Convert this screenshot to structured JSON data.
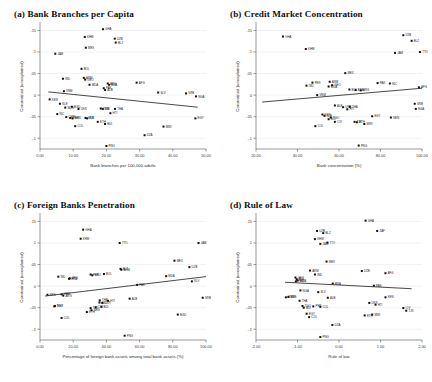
{
  "figure": {
    "width": 432,
    "height": 382,
    "background": "#ffffff",
    "marker_color": "#111111",
    "fitline_color": "#1a1a1a",
    "grid_color": "#e9e9ee",
    "axis_color": "#555555",
    "caption": ""
  },
  "chart_data": [
    {
      "type": "scatter",
      "panel": "a",
      "title": "(a) Bank Branches per Capita",
      "xlabel": "Bank branches per 100,000 adults",
      "ylabel": "Constrained (unexplained)",
      "xlim": [
        0,
        50
      ],
      "ylim": [
        -0.125,
        0.165
      ],
      "xticks": [
        0,
        10,
        20,
        30,
        40,
        50
      ],
      "xticklabels": [
        "0.00",
        "10.00",
        "20.00",
        "30.00",
        "40.00",
        "50.00"
      ],
      "yticks": [
        0.15,
        0.1,
        0.05,
        0,
        -0.05,
        -0.1
      ],
      "yticklabels": [
        ".15",
        ".1",
        ".05",
        "0",
        "-.05",
        "-.1"
      ],
      "grid": true,
      "fit_line": {
        "x": [
          2.5,
          47.5
        ],
        "y": [
          0.0075,
          -0.028
        ]
      },
      "points": [
        {
          "label": "GHA",
          "x": 19.0,
          "y": 0.153
        },
        {
          "label": "KHM",
          "x": 13.5,
          "y": 0.135
        },
        {
          "label": "UZB",
          "x": 22.5,
          "y": 0.131
        },
        {
          "label": "BLZ",
          "x": 22.8,
          "y": 0.122
        },
        {
          "label": "MEX",
          "x": 13.8,
          "y": 0.11
        },
        {
          "label": "JAM",
          "x": 4.6,
          "y": 0.096
        },
        {
          "label": "BOL",
          "x": 12.5,
          "y": 0.061
        },
        {
          "label": "IND",
          "x": 6.9,
          "y": 0.038
        },
        {
          "label": "ARM",
          "x": 13.2,
          "y": 0.04
        },
        {
          "label": "GEO",
          "x": 13.6,
          "y": 0.036
        },
        {
          "label": "MDA",
          "x": 14.9,
          "y": 0.024
        },
        {
          "label": "AFG",
          "x": 29.1,
          "y": 0.029
        },
        {
          "label": "ARG",
          "x": 20.4,
          "y": 0.027
        },
        {
          "label": "BRA",
          "x": 20.8,
          "y": 0.024
        },
        {
          "label": "PAK",
          "x": 19.2,
          "y": 0.016
        },
        {
          "label": "ALB",
          "x": 19.6,
          "y": 0.012
        },
        {
          "label": "VNM",
          "x": 7.2,
          "y": 0.009
        },
        {
          "label": "SLV",
          "x": 35.6,
          "y": 0.006
        },
        {
          "label": "SRB",
          "x": 44.0,
          "y": 0.004
        },
        {
          "label": "NGA",
          "x": 47.0,
          "y": -0.003
        },
        {
          "label": "KEN",
          "x": 2.9,
          "y": -0.01
        },
        {
          "label": "SLE",
          "x": 6.0,
          "y": -0.02
        },
        {
          "label": "MDG",
          "x": 7.6,
          "y": -0.029
        },
        {
          "label": "BGD",
          "x": 9.6,
          "y": -0.027
        },
        {
          "label": "UKR",
          "x": 11.6,
          "y": -0.032
        },
        {
          "label": "ZMB",
          "x": 18.3,
          "y": -0.031
        },
        {
          "label": "CIV",
          "x": 18.9,
          "y": -0.032
        },
        {
          "label": "THA",
          "x": 22.6,
          "y": -0.032
        },
        {
          "label": "NIC",
          "x": 5.2,
          "y": -0.044
        },
        {
          "label": "HTI",
          "x": 21.2,
          "y": -0.042
        },
        {
          "label": "CMR",
          "x": 7.9,
          "y": -0.051
        },
        {
          "label": "TGO",
          "x": 9.1,
          "y": -0.053
        },
        {
          "label": "BEN",
          "x": 9.8,
          "y": -0.054
        },
        {
          "label": "SEN",
          "x": 13.7,
          "y": -0.053
        },
        {
          "label": "TJK",
          "x": 14.2,
          "y": -0.054
        },
        {
          "label": "EGY",
          "x": 46.8,
          "y": -0.054
        },
        {
          "label": "ETH",
          "x": 17.4,
          "y": -0.062
        },
        {
          "label": "BDI",
          "x": 19.6,
          "y": -0.067
        },
        {
          "label": "COL",
          "x": 10.6,
          "y": -0.072
        },
        {
          "label": "MWI",
          "x": 37.2,
          "y": -0.073
        },
        {
          "label": "DZA",
          "x": 31.5,
          "y": -0.093
        },
        {
          "label": "PNG",
          "x": 20.0,
          "y": -0.118
        }
      ]
    },
    {
      "type": "scatter",
      "panel": "b",
      "title": "(b) Credit Market Concentration",
      "xlabel": "Bank concentration (%)",
      "ylabel": "Constrained (unexplained)",
      "xlim": [
        20,
        100
      ],
      "ylim": [
        -0.125,
        0.165
      ],
      "xticks": [
        20,
        40,
        60,
        80,
        100
      ],
      "xticklabels": [
        "20.00",
        "40.00",
        "60.00",
        "80.00",
        "100.00"
      ],
      "yticks": [
        0.15,
        0.1,
        0.05,
        0,
        -0.05,
        -0.1
      ],
      "yticklabels": [
        ".15",
        ".1",
        ".05",
        "0",
        "-.05",
        "-.1"
      ],
      "grid": true,
      "fit_line": {
        "x": [
          23,
          100
        ],
        "y": [
          -0.016,
          0.016
        ]
      },
      "points": [
        {
          "label": "GHA",
          "x": 33.0,
          "y": 0.136
        },
        {
          "label": "UZB",
          "x": 91.0,
          "y": 0.139
        },
        {
          "label": "BLZ",
          "x": 95.0,
          "y": 0.126
        },
        {
          "label": "KHM",
          "x": 44.0,
          "y": 0.107
        },
        {
          "label": "JAM",
          "x": 87.0,
          "y": 0.098
        },
        {
          "label": "TTO",
          "x": 99.0,
          "y": 0.1
        },
        {
          "label": "MEX",
          "x": 63.0,
          "y": 0.051
        },
        {
          "label": "ARM",
          "x": 55.5,
          "y": 0.031
        },
        {
          "label": "PER",
          "x": 47.2,
          "y": 0.029
        },
        {
          "label": "PAK",
          "x": 78.6,
          "y": 0.028
        },
        {
          "label": "NIC",
          "x": 84.5,
          "y": 0.027
        },
        {
          "label": "IND",
          "x": 44.3,
          "y": 0.022
        },
        {
          "label": "GEO",
          "x": 56.7,
          "y": 0.023
        },
        {
          "label": "MDA",
          "x": 55.0,
          "y": 0.02
        },
        {
          "label": "AFG",
          "x": 98.5,
          "y": 0.018
        },
        {
          "label": "BOL",
          "x": 65.0,
          "y": 0.013
        },
        {
          "label": "BRA",
          "x": 68.0,
          "y": 0.012
        },
        {
          "label": "ARG",
          "x": 70.5,
          "y": 0.011
        },
        {
          "label": "VNM",
          "x": 49.5,
          "y": 0.0
        },
        {
          "label": "SRB",
          "x": 96.5,
          "y": -0.02
        },
        {
          "label": "ALB",
          "x": 58.0,
          "y": -0.024
        },
        {
          "label": "UKR",
          "x": 62.0,
          "y": -0.028
        },
        {
          "label": "THA",
          "x": 65.2,
          "y": -0.027
        },
        {
          "label": "HTI",
          "x": 64.0,
          "y": -0.033
        },
        {
          "label": "NGA",
          "x": 97.0,
          "y": -0.032
        },
        {
          "label": "KEN",
          "x": 52.0,
          "y": -0.045
        },
        {
          "label": "SLE",
          "x": 53.0,
          "y": -0.048
        },
        {
          "label": "EGY",
          "x": 76.0,
          "y": -0.049
        },
        {
          "label": "TGO",
          "x": 56.0,
          "y": -0.052
        },
        {
          "label": "BDI",
          "x": 55.0,
          "y": -0.056
        },
        {
          "label": "SEN",
          "x": 85.0,
          "y": -0.052
        },
        {
          "label": "CIV",
          "x": 58.0,
          "y": -0.062
        },
        {
          "label": "TJK",
          "x": 67.5,
          "y": -0.062
        },
        {
          "label": "ETH",
          "x": 68.6,
          "y": -0.063
        },
        {
          "label": "MWI",
          "x": 72.2,
          "y": -0.067
        },
        {
          "label": "COL",
          "x": 48.6,
          "y": -0.072
        },
        {
          "label": "PNG",
          "x": 69.5,
          "y": -0.117
        }
      ]
    },
    {
      "type": "scatter",
      "panel": "c",
      "title": "(c) Foreign Banks Penetration",
      "xlabel": "Percentage of foreign bank assets among total bank assets (%)",
      "ylabel": "Constrained (unexplained)",
      "xlim": [
        0,
        100
      ],
      "ylim": [
        -0.125,
        0.165
      ],
      "xticks": [
        0,
        20,
        40,
        60,
        80,
        100
      ],
      "xticklabels": [
        "0.00",
        "20.00",
        "40.00",
        "60.00",
        "80.00",
        "100.00"
      ],
      "yticks": [
        0.15,
        0.1,
        0.05,
        0,
        -0.05,
        -0.1
      ],
      "yticklabels": [
        ".15",
        ".1",
        ".05",
        "0",
        "-.05",
        "-.1"
      ],
      "grid": true,
      "fit_line": {
        "x": [
          3,
          100
        ],
        "y": [
          -0.023,
          0.022
        ]
      },
      "points": [
        {
          "label": "GHA",
          "x": 26.0,
          "y": 0.131
        },
        {
          "label": "KHM",
          "x": 24.5,
          "y": 0.11
        },
        {
          "label": "TTO",
          "x": 48.0,
          "y": 0.1
        },
        {
          "label": "JAM",
          "x": 95.5,
          "y": 0.1
        },
        {
          "label": "MEX",
          "x": 81.0,
          "y": 0.059
        },
        {
          "label": "UZB",
          "x": 90.0,
          "y": 0.044
        },
        {
          "label": "ARM",
          "x": 49.0,
          "y": 0.038
        },
        {
          "label": "BLZ",
          "x": 48.5,
          "y": 0.04
        },
        {
          "label": "BOL",
          "x": 38.5,
          "y": 0.028
        },
        {
          "label": "GEO",
          "x": 31.5,
          "y": 0.025
        },
        {
          "label": "PER",
          "x": 30.5,
          "y": 0.027
        },
        {
          "label": "MDA",
          "x": 76.0,
          "y": 0.023
        },
        {
          "label": "IND",
          "x": 11.0,
          "y": 0.022
        },
        {
          "label": "AFG",
          "x": 18.0,
          "y": 0.018
        },
        {
          "label": "BRA",
          "x": 17.5,
          "y": 0.017
        },
        {
          "label": "SLV",
          "x": 91.5,
          "y": 0.011
        },
        {
          "label": "PAK",
          "x": 58.5,
          "y": 0.003
        },
        {
          "label": "KEN",
          "x": 4.5,
          "y": -0.02
        },
        {
          "label": "VNM",
          "x": 13.0,
          "y": -0.019
        },
        {
          "label": "ARG",
          "x": 14.0,
          "y": -0.022
        },
        {
          "label": "SRB",
          "x": 98.0,
          "y": -0.027
        },
        {
          "label": "ALB",
          "x": 54.0,
          "y": -0.029
        },
        {
          "label": "THA",
          "x": 36.0,
          "y": -0.033
        },
        {
          "label": "HTI",
          "x": 41.0,
          "y": -0.034
        },
        {
          "label": "NIC",
          "x": 35.8,
          "y": -0.038
        },
        {
          "label": "UKR",
          "x": 37.5,
          "y": -0.039
        },
        {
          "label": "EGY",
          "x": 9.0,
          "y": -0.046
        },
        {
          "label": "TGO",
          "x": 8.6,
          "y": -0.047
        },
        {
          "label": "CIV",
          "x": 33.5,
          "y": -0.049
        },
        {
          "label": "TJK",
          "x": 30.5,
          "y": -0.051
        },
        {
          "label": "BDI",
          "x": 37.0,
          "y": -0.048
        },
        {
          "label": "SEN",
          "x": 31.0,
          "y": -0.056
        },
        {
          "label": "ETH",
          "x": 28.2,
          "y": -0.06
        },
        {
          "label": "BGD",
          "x": 83.0,
          "y": -0.066
        },
        {
          "label": "COL",
          "x": 13.0,
          "y": -0.074
        },
        {
          "label": "PNG",
          "x": 51.0,
          "y": -0.115
        }
      ]
    },
    {
      "type": "scatter",
      "panel": "d",
      "title": "(d) Rule of Law",
      "xlabel": "Rule of law",
      "ylabel": "Constrained (unexplained)",
      "xlim": [
        -2,
        2
      ],
      "ylim": [
        -0.125,
        0.165
      ],
      "xticks": [
        -2,
        -1,
        0,
        1,
        2
      ],
      "xticklabels": [
        "-2.00",
        "-1.00",
        "0.00",
        "1.00",
        "2.00"
      ],
      "yticks": [
        0.15,
        0.1,
        0.05,
        0,
        -0.05,
        -0.1
      ],
      "yticklabels": [
        ".15",
        ".1",
        ".05",
        "0",
        "-.05",
        "-.1"
      ],
      "grid": true,
      "fit_line": {
        "x": [
          -1.3,
          1.75
        ],
        "y": [
          0.009,
          -0.006
        ]
      },
      "points": [
        {
          "label": "GHA",
          "x": 0.64,
          "y": 0.152
        },
        {
          "label": "UZB",
          "x": -0.53,
          "y": 0.128
        },
        {
          "label": "BLZ",
          "x": -0.38,
          "y": 0.123
        },
        {
          "label": "ZAF",
          "x": 0.92,
          "y": 0.128
        },
        {
          "label": "KHM",
          "x": -0.58,
          "y": 0.109
        },
        {
          "label": "JAM",
          "x": -0.45,
          "y": 0.098
        },
        {
          "label": "TTO",
          "x": -0.28,
          "y": 0.101
        },
        {
          "label": "MEX",
          "x": -0.3,
          "y": 0.057
        },
        {
          "label": "ARM",
          "x": -0.7,
          "y": 0.036
        },
        {
          "label": "UZB2",
          "x": 0.55,
          "y": 0.035
        },
        {
          "label": "AFG",
          "x": 1.12,
          "y": 0.03
        },
        {
          "label": "IND",
          "x": -0.58,
          "y": 0.027
        },
        {
          "label": "GEO",
          "x": -1.05,
          "y": 0.02
        },
        {
          "label": "BOL",
          "x": -1.02,
          "y": 0.016
        },
        {
          "label": "MDA",
          "x": -1.0,
          "y": 0.013
        },
        {
          "label": "PER",
          "x": -1.04,
          "y": 0.011
        },
        {
          "label": "BRA",
          "x": -0.15,
          "y": 0.006
        },
        {
          "label": "PAK",
          "x": 0.84,
          "y": 0.001
        },
        {
          "label": "NGA",
          "x": -0.93,
          "y": -0.01
        },
        {
          "label": "SLV",
          "x": -0.5,
          "y": -0.014
        },
        {
          "label": "VNM",
          "x": -1.28,
          "y": -0.026
        },
        {
          "label": "SRB",
          "x": -1.22,
          "y": -0.025
        },
        {
          "label": "ALB",
          "x": -0.27,
          "y": -0.027
        },
        {
          "label": "KEN",
          "x": 1.12,
          "y": -0.026
        },
        {
          "label": "THA",
          "x": -0.95,
          "y": -0.034
        },
        {
          "label": "UKR",
          "x": 0.73,
          "y": -0.039
        },
        {
          "label": "HTI",
          "x": 0.88,
          "y": -0.043
        },
        {
          "label": "TGO",
          "x": -0.88,
          "y": -0.046
        },
        {
          "label": "BDI",
          "x": -0.85,
          "y": -0.05
        },
        {
          "label": "PER2",
          "x": -0.62,
          "y": -0.047
        },
        {
          "label": "COL",
          "x": -0.45,
          "y": -0.048
        },
        {
          "label": "CIV",
          "x": 1.55,
          "y": -0.051
        },
        {
          "label": "TJK",
          "x": 1.62,
          "y": -0.057
        },
        {
          "label": "EGY",
          "x": -0.78,
          "y": -0.064
        },
        {
          "label": "ETH",
          "x": 0.62,
          "y": -0.068
        },
        {
          "label": "MWI",
          "x": 0.8,
          "y": -0.066
        },
        {
          "label": "COL2",
          "x": -0.72,
          "y": -0.072
        },
        {
          "label": "DZA",
          "x": -0.16,
          "y": -0.09
        },
        {
          "label": "PNG",
          "x": -0.45,
          "y": -0.118
        }
      ]
    }
  ]
}
